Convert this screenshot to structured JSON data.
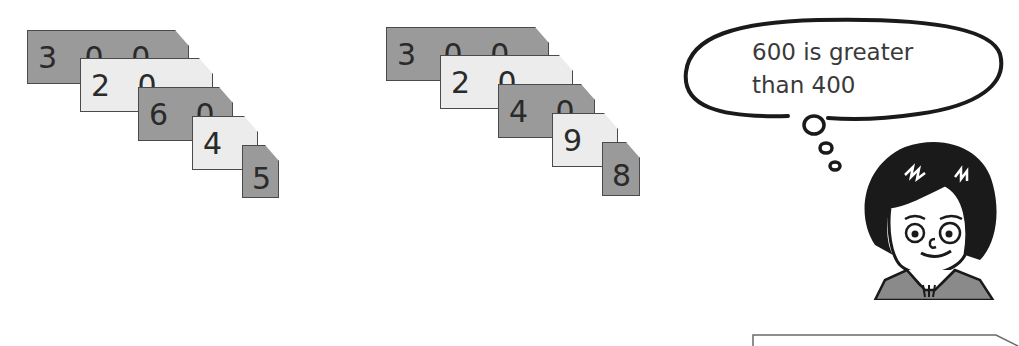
{
  "left_cards": {
    "number": "32645",
    "cards": [
      {
        "label": "3 0 0 0 0",
        "shade": "dark"
      },
      {
        "label": "2 0 0 0",
        "shade": "light"
      },
      {
        "label": "6 0 0",
        "shade": "dark"
      },
      {
        "label": "4 0",
        "shade": "light"
      },
      {
        "label": "5",
        "shade": "dark"
      }
    ]
  },
  "right_cards": {
    "number": "32498",
    "cards": [
      {
        "label": "3 0 0 0 0",
        "shade": "dark"
      },
      {
        "label": "2 0 0 0",
        "shade": "light"
      },
      {
        "label": "4 0 0",
        "shade": "dark"
      },
      {
        "label": "9 0",
        "shade": "light"
      },
      {
        "label": "8",
        "shade": "dark"
      }
    ]
  },
  "thought_bubble": {
    "line1": "600 is greater",
    "line2": "than 400"
  },
  "character": {
    "name": "girl-thinking"
  },
  "colors": {
    "dark_card": "#9a9a9a",
    "light_card": "#ececec",
    "outline": "#4a4a4a",
    "ink": "#1a1a1a"
  }
}
